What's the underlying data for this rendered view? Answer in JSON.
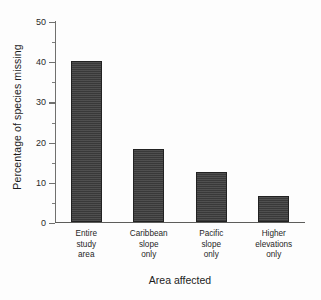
{
  "chart_data": {
    "type": "bar",
    "title": "",
    "xlabel": "Area affected",
    "ylabel": "Percentage of species missing",
    "categories": [
      "Entire\nstudy\narea",
      "Caribbean\nslope\nonly",
      "Pacific\nslope\nonly",
      "Higher\nelevations\nonly"
    ],
    "values": [
      40.2,
      18.2,
      12.4,
      6.5
    ],
    "ylim": [
      0,
      50
    ],
    "ytick_labels": [
      "0",
      "10",
      "20",
      "30",
      "40",
      "50"
    ],
    "ytick_values": [
      0,
      10,
      20,
      30,
      40,
      50
    ],
    "yminor_tick_values": [
      5,
      15,
      25,
      35,
      45
    ],
    "grid": false,
    "legend": null,
    "bar_color": "#3f3f3f",
    "bar_edge_color": "#222222",
    "axis_color": "#70706e",
    "background_color": "#fdfdfd"
  }
}
